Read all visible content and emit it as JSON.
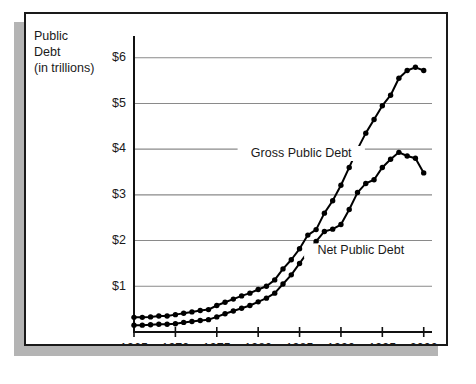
{
  "figure": {
    "frame_color": "#1a1a1a",
    "shadow_color": "#b4b4b4",
    "background": "#ffffff"
  },
  "axis_title": {
    "line1": "Public",
    "line2": "Debt",
    "line3": "(in trillions)"
  },
  "series_labels": {
    "gross": "Gross Public Debt",
    "net": "Net Public Debt"
  },
  "chart_data": {
    "type": "line",
    "title": "",
    "subtitle": "",
    "xlabel": "",
    "ylabel": "Public Debt (in trillions)",
    "xlim": [
      1965,
      2001
    ],
    "ylim": [
      0,
      6.3
    ],
    "xticks": [
      1965,
      1970,
      1975,
      1980,
      1985,
      1990,
      1995,
      2000
    ],
    "xtick_labels": [
      "1965",
      "1970",
      "1975",
      "1980",
      "1985",
      "1990",
      "1995",
      "2000"
    ],
    "yticks": [
      1,
      2,
      3,
      4,
      5,
      6
    ],
    "ytick_labels": [
      "$1",
      "$2",
      "$3",
      "$4",
      "$5",
      "$6"
    ],
    "grid": "horizontal",
    "legend_position": "inline-annotations",
    "line_color": "#000000",
    "marker": "filled-circle",
    "x": [
      1965,
      1966,
      1967,
      1968,
      1969,
      1970,
      1971,
      1972,
      1973,
      1974,
      1975,
      1976,
      1977,
      1978,
      1979,
      1980,
      1981,
      1982,
      1983,
      1984,
      1985,
      1986,
      1987,
      1988,
      1989,
      1990,
      1991,
      1992,
      1993,
      1994,
      1995,
      1996,
      1997,
      1998,
      1999,
      2000
    ],
    "series": [
      {
        "name": "Gross Public Debt",
        "values": [
          0.32,
          0.32,
          0.33,
          0.35,
          0.35,
          0.38,
          0.41,
          0.44,
          0.47,
          0.49,
          0.58,
          0.65,
          0.72,
          0.79,
          0.85,
          0.93,
          1.0,
          1.14,
          1.38,
          1.58,
          1.82,
          2.12,
          2.24,
          2.6,
          2.87,
          3.21,
          3.6,
          4.0,
          4.35,
          4.65,
          4.95,
          5.18,
          5.55,
          5.72,
          5.79,
          5.72
        ]
      },
      {
        "name": "Net Public Debt",
        "values": [
          0.15,
          0.15,
          0.16,
          0.17,
          0.17,
          0.18,
          0.21,
          0.23,
          0.25,
          0.27,
          0.33,
          0.4,
          0.46,
          0.52,
          0.58,
          0.66,
          0.74,
          0.85,
          1.05,
          1.25,
          1.5,
          1.75,
          1.98,
          2.2,
          2.25,
          2.35,
          2.68,
          3.05,
          3.25,
          3.33,
          3.6,
          3.78,
          3.93,
          3.85,
          3.8,
          3.48
        ]
      }
    ],
    "annotations": [
      {
        "text": "Gross Public Debt",
        "x": 1985.2,
        "y": 3.85
      },
      {
        "text": "Net Public Debt",
        "x": 1992.4,
        "y": 1.72
      }
    ]
  }
}
